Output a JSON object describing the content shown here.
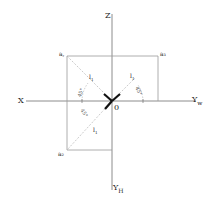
{
  "diagram": {
    "type": "orthographic-projection-of-point",
    "axes": {
      "z": {
        "label": "Z"
      },
      "x": {
        "label": "X"
      },
      "yw": {
        "label": "Y",
        "sub": "w"
      },
      "yh": {
        "label": "Y",
        "sub": "H"
      },
      "origin": {
        "label": "0"
      }
    },
    "points": {
      "a_prime": {
        "label": "a",
        "mark": ","
      },
      "a_double_prime": {
        "label": "a",
        "mark": "₃"
      },
      "a": {
        "label": "a",
        "mark": "₂"
      }
    },
    "lengths": {
      "l1_left": {
        "label": "l",
        "sub": "1"
      },
      "l1_right": {
        "label": "l",
        "sub": "1"
      },
      "l1_bottom": {
        "label": "l",
        "sub": "1"
      }
    },
    "angles": {
      "left_upper": "45°",
      "right_upper": "45°",
      "left_lower": "45°"
    },
    "colors": {
      "line": "#9a9a9a",
      "axis": "#8c8c8c",
      "arrow": "#111111",
      "text": "#222222"
    }
  }
}
